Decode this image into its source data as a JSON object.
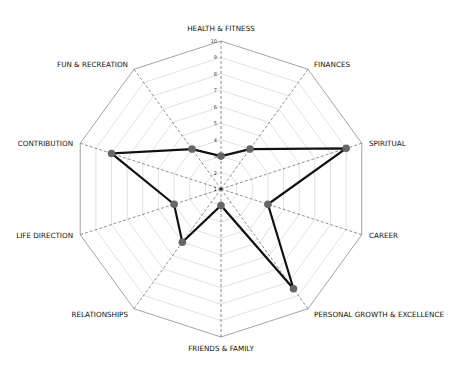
{
  "chart_data": {
    "type": "radar",
    "title": "",
    "categories": [
      "HEALTH & FITNESS",
      "FINANCES",
      "SPIRITUAL",
      "CAREER",
      "PERSONAL GROWTH & EXCELLENCE",
      "FRIENDS & FAMILY",
      "RELATIONSHIPS",
      "LIFE DIRECTION",
      "CONTRIBUTION",
      "FUN & RECREATION"
    ],
    "series": [
      {
        "name": "Score",
        "values": [
          3,
          4,
          9,
          4,
          8.5,
          2,
          5,
          4,
          8,
          4
        ],
        "color": "#111111",
        "marker_color": "#666666"
      }
    ],
    "ticks": [
      "1",
      "2",
      "3",
      "4",
      "5",
      "6",
      "7",
      "8",
      "9",
      "10"
    ],
    "rlim": [
      1,
      10
    ],
    "grid": true,
    "legend": false,
    "colors": {
      "outer_ring": "#999999",
      "grid": "#cccccc",
      "axis": "#444444"
    }
  }
}
